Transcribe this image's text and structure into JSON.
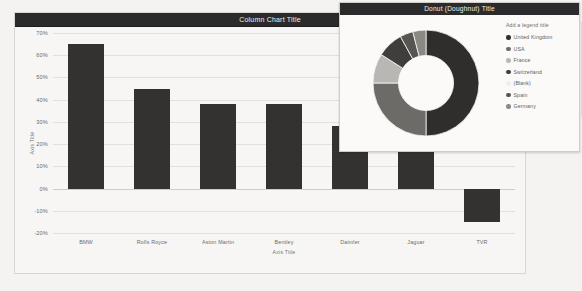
{
  "column_chart": {
    "title": "Column Chart Title",
    "x_axis_title": "Axis Title",
    "y_axis_title": "Axis Title"
  },
  "donut_chart": {
    "title": "Donut (Doughnut) Title",
    "legend_header": "Add a legend title"
  },
  "chart_data": [
    {
      "type": "bar",
      "title": "Column Chart Title",
      "xlabel": "Axis Title",
      "ylabel": "Axis Title",
      "categories": [
        "BMW",
        "Rolls Royce",
        "Aston Martin",
        "Bentley",
        "Daimler",
        "Jaguar",
        "TVR"
      ],
      "values": [
        65,
        45,
        38,
        38,
        28,
        22,
        -15
      ],
      "ylim": [
        -20,
        70
      ],
      "ytick_labels": [
        "70%",
        "60%",
        "50%",
        "40%",
        "30%",
        "20%",
        "10%",
        "0%",
        "-10%",
        "-20%"
      ],
      "ytick_values": [
        70,
        60,
        50,
        40,
        30,
        20,
        10,
        0,
        -10,
        -20
      ],
      "grid": true,
      "legend": "none",
      "series_color": "#333231"
    },
    {
      "type": "pie",
      "variant": "donut",
      "title": "Donut (Doughnut) Title",
      "legend_title": "Add a legend title",
      "labels": [
        "United Kingdom",
        "USA",
        "France",
        "Switzerland",
        "(Blank)",
        "Spain",
        "Germany"
      ],
      "values": [
        50,
        25,
        9,
        8,
        0,
        4,
        4
      ],
      "colors": [
        "#2f2e2d",
        "#6d6b68",
        "#b9b7b3",
        "#3f3e3c",
        "#efeeec",
        "#57554f",
        "#8b8984"
      ],
      "legend_position": "right",
      "hole": 0.52
    }
  ]
}
